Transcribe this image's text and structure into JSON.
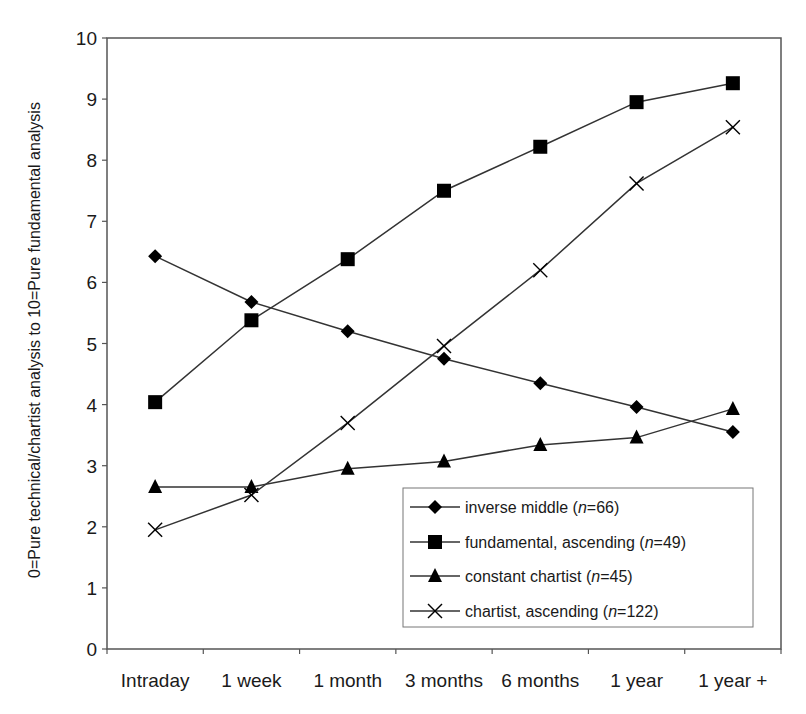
{
  "chart_data": {
    "type": "line",
    "title": "",
    "xlabel": "",
    "ylabel": "0=Pure technical/chartist analysis to 10=Pure fundamental analysis",
    "ylim": [
      0,
      10
    ],
    "yticks": [
      "0",
      "1",
      "2",
      "3",
      "4",
      "5",
      "6",
      "7",
      "8",
      "9",
      "10"
    ],
    "grid": false,
    "legend_position": "lower right (inside plot)",
    "categories": [
      "Intraday",
      "1 week",
      "1 month",
      "3 months",
      "6 months",
      "1 year",
      "1 year +"
    ],
    "series": [
      {
        "name": "inverse middle",
        "n": "66",
        "marker": "diamond",
        "values": [
          6.43,
          5.68,
          5.2,
          4.75,
          4.35,
          3.96,
          3.55
        ]
      },
      {
        "name": "fundamental, ascending",
        "n": "49",
        "marker": "square",
        "values": [
          4.04,
          5.38,
          6.38,
          7.5,
          8.22,
          8.95,
          9.26
        ]
      },
      {
        "name": "constant chartist",
        "n": "45",
        "marker": "triangle",
        "values": [
          2.65,
          2.65,
          2.95,
          3.07,
          3.34,
          3.46,
          3.93
        ]
      },
      {
        "name": "chartist, ascending",
        "n": "122",
        "marker": "x",
        "values": [
          1.95,
          2.52,
          3.7,
          4.96,
          6.2,
          7.62,
          8.54
        ]
      }
    ]
  },
  "legend": {
    "items": [
      {
        "label": "inverse middle (",
        "n_italic": "n",
        "suffix": "=66)"
      },
      {
        "label": "fundamental, ascending (",
        "n_italic": "n",
        "suffix": "=49)"
      },
      {
        "label": "constant chartist (",
        "n_italic": "n",
        "suffix": "=45)"
      },
      {
        "label": "chartist, ascending (",
        "n_italic": "n",
        "suffix": "=122)"
      }
    ]
  },
  "colors": {
    "line": "#333333",
    "marker": "#000000",
    "axis": "#555555",
    "background": "#ffffff"
  }
}
